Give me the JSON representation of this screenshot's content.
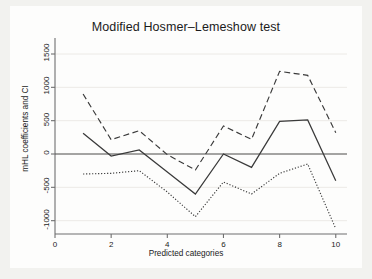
{
  "chart_data": {
    "type": "line",
    "title": "Modified Hosmer–Lemeshow test",
    "xlabel": "Predicted categories",
    "ylabel": "mHL coefficients and CI",
    "x": [
      1,
      2,
      3,
      4,
      5,
      6,
      7,
      8,
      9,
      10
    ],
    "xlim": [
      0,
      10.4
    ],
    "ylim": [
      -1200,
      1650
    ],
    "xticks": [
      0,
      2,
      4,
      6,
      8,
      10
    ],
    "xticklabels": [
      "0",
      "2",
      "4",
      "6",
      "8",
      "10"
    ],
    "yticks": [
      -1000,
      -500,
      0,
      500,
      1000,
      1500
    ],
    "yticklabels": [
      "-1000",
      "-500",
      "0",
      "500",
      "1000",
      "1500"
    ],
    "grid": true,
    "grid_axis": "y",
    "legend": "none",
    "zero_line": 0,
    "series": [
      {
        "name": "mHL coefficient",
        "style": "solid",
        "color": "#3a3a3a",
        "values": [
          310,
          -30,
          60,
          -270,
          -600,
          0,
          -200,
          490,
          510,
          -400
        ]
      },
      {
        "name": "Upper CI",
        "style": "dashed",
        "color": "#3a3a3a",
        "values": [
          900,
          215,
          350,
          -10,
          -240,
          420,
          220,
          1240,
          1180,
          320
        ]
      },
      {
        "name": "Lower CI",
        "style": "dotted",
        "color": "#3a3a3a",
        "values": [
          -300,
          -290,
          -250,
          -570,
          -940,
          -420,
          -600,
          -290,
          -150,
          -1120
        ]
      }
    ]
  },
  "figure": {
    "background": "#f2f2ef",
    "plot_background": "#fdfdfc",
    "axis_color": "#6f6f6f",
    "grid_color": "#eceae6"
  }
}
